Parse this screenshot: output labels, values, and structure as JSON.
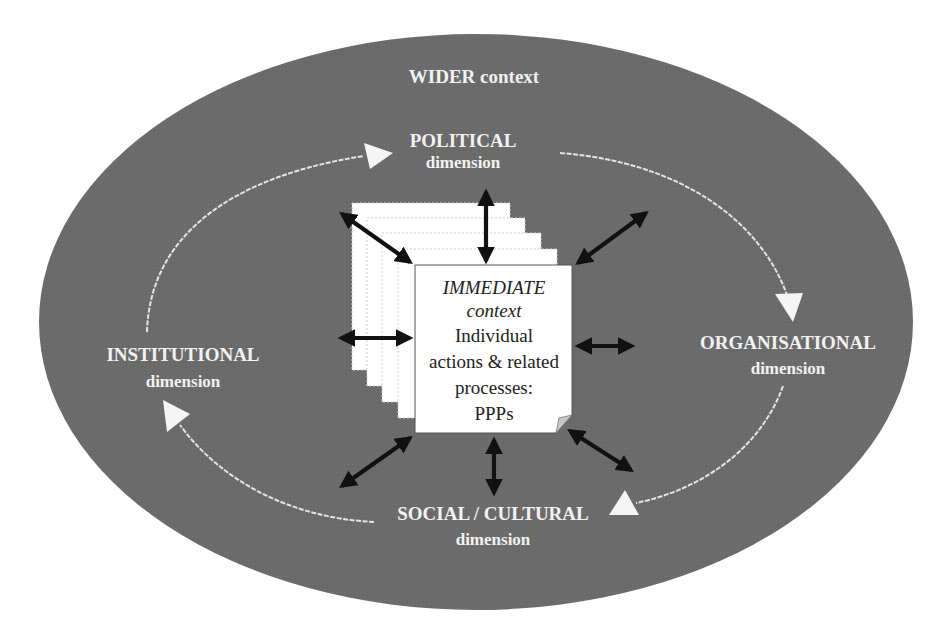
{
  "diagram": {
    "type": "nested-context-diagram",
    "colors": {
      "outer_fill": "#6b6b6b",
      "label_text": "#f2f2f2",
      "cycle_arrows": "#e4e4e4",
      "page_fill": "#ffffff",
      "page_border": "#555555",
      "double_arrows": "#111111",
      "page_text": "#222222"
    },
    "outer": {
      "label": "WIDER context"
    },
    "dimensions": [
      {
        "id": "political",
        "title": "POLITICAL",
        "subtitle": "dimension",
        "position": "top"
      },
      {
        "id": "organisational",
        "title": "ORGANISATIONAL",
        "subtitle": "dimension",
        "position": "right"
      },
      {
        "id": "social-cultural",
        "title": "SOCIAL / CULTURAL",
        "subtitle": "dimension",
        "position": "bottom"
      },
      {
        "id": "institutional",
        "title": "INSTITUTIONAL",
        "subtitle": "dimension",
        "position": "left"
      }
    ],
    "cycle": {
      "direction": "clockwise",
      "sequence": [
        "INSTITUTIONAL",
        "POLITICAL",
        "ORGANISATIONAL",
        "SOCIAL / CULTURAL",
        "INSTITUTIONAL"
      ]
    },
    "center": {
      "line1": "IMMEDIATE",
      "line2": "context",
      "line3": "Individual",
      "line4": "actions & related",
      "line5": "processes:",
      "line6": "PPPs",
      "stacked_pages": 5
    },
    "connectors": {
      "count": 8,
      "style": "double-headed arrows",
      "directions": [
        "top-left",
        "top",
        "top-right",
        "left",
        "right",
        "bottom-left",
        "bottom",
        "bottom-right"
      ]
    }
  }
}
